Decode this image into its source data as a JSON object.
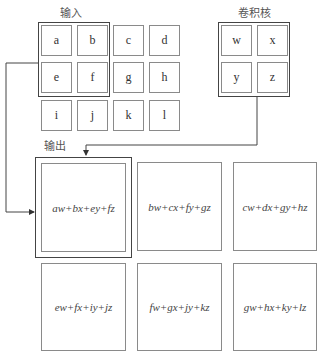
{
  "input": {
    "title": "输入",
    "cells": [
      [
        "a",
        "b",
        "c",
        "d"
      ],
      [
        "e",
        "f",
        "g",
        "h"
      ],
      [
        "i",
        "j",
        "k",
        "l"
      ]
    ]
  },
  "kernel": {
    "title": "卷积核",
    "cells": [
      [
        "w",
        "x"
      ],
      [
        "y",
        "z"
      ]
    ]
  },
  "output": {
    "title": "输出",
    "cells": [
      [
        "aw+bx+ey+fz",
        "bw+cx+fy+gz",
        "cw+dx+gy+hz"
      ],
      [
        "ew+fx+iy+jz",
        "fw+gx+jy+kz",
        "gw+hx+ky+lz"
      ]
    ]
  },
  "colors": {
    "line": "#444444",
    "cell_border": "#8a8a8a"
  }
}
